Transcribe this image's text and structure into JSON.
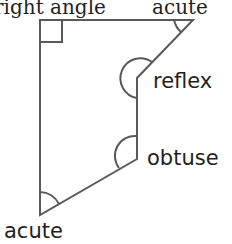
{
  "diagram": {
    "labels": {
      "top_left": "right angle",
      "top_right": "acute",
      "reflex": "reflex",
      "obtuse": "obtuse",
      "bottom_left": "acute"
    },
    "stroke_color": "#58595b",
    "text_color": "#231f20"
  }
}
